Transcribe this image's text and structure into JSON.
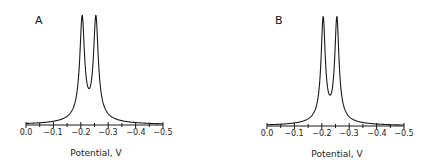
{
  "chart_data": [
    {
      "type": "line",
      "panel_label": "A",
      "xlabel": "Potential, V",
      "ylabel": "",
      "xlim": [
        0.0,
        -0.5
      ],
      "x_ticks": [
        "0.0",
        "−0.1",
        "−0.2",
        "−0.3",
        "−0.4",
        "−0.5"
      ],
      "x_tick_values": [
        0.0,
        -0.1,
        -0.2,
        -0.3,
        -0.4,
        -0.5
      ],
      "minor_tick_step": 0.05,
      "grid": false,
      "series": [
        {
          "name": "voltammogram A",
          "peaks": [
            {
              "potential": -0.205,
              "relative_height": 1.0
            },
            {
              "potential": -0.255,
              "relative_height": 1.0
            }
          ],
          "valley": {
            "potential": -0.23,
            "relative_height": 0.33
          },
          "peak_width_v": 0.018
        }
      ]
    },
    {
      "type": "line",
      "panel_label": "B",
      "xlabel": "Potential, V",
      "ylabel": "",
      "xlim": [
        0.0,
        -0.5
      ],
      "x_ticks": [
        "0.0",
        "−0.1",
        "−0.2",
        "−0.3",
        "−0.4",
        "−0.5"
      ],
      "x_tick_values": [
        0.0,
        -0.1,
        -0.2,
        -0.3,
        -0.4,
        -0.5
      ],
      "minor_tick_step": 0.05,
      "grid": false,
      "series": [
        {
          "name": "voltammogram B",
          "peaks": [
            {
              "potential": -0.205,
              "relative_height": 1.0
            },
            {
              "potential": -0.255,
              "relative_height": 1.0
            }
          ],
          "valley": {
            "potential": -0.23,
            "relative_height": 0.28
          },
          "peak_width_v": 0.016
        }
      ]
    }
  ],
  "panels": [
    {
      "label": "A",
      "xlabel": "Potential, V",
      "ticks": [
        "0.0",
        "−0.1",
        "−0.2",
        "−0.3",
        "−0.4",
        "−0.5"
      ]
    },
    {
      "label": "B",
      "xlabel": "Potential, V",
      "ticks": [
        "0.0",
        "−0.1",
        "−0.2",
        "−0.3",
        "−0.4",
        "−0.5"
      ]
    }
  ],
  "colors": {
    "line": "#1a1a1a",
    "background": "#ffffff"
  }
}
